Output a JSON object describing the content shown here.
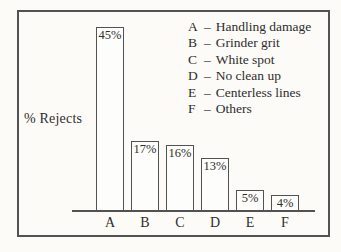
{
  "chart_data": {
    "type": "bar",
    "title": "",
    "ylabel": "% Rejects",
    "xlabel": "",
    "categories": [
      "A",
      "B",
      "C",
      "D",
      "E",
      "F"
    ],
    "values": [
      45,
      17,
      16,
      13,
      5,
      4
    ],
    "bar_labels": [
      "45%",
      "17%",
      "16%",
      "13%",
      "5%",
      "4%"
    ],
    "ylim": [
      0,
      50
    ],
    "grid": false,
    "axis_lines": "x-only",
    "legend_position": "top-right",
    "legend_separator": "–",
    "legend": [
      {
        "key": "A",
        "label": "Handling damage"
      },
      {
        "key": "B",
        "label": "Grinder grit"
      },
      {
        "key": "C",
        "label": "White spot"
      },
      {
        "key": "D",
        "label": "No clean up"
      },
      {
        "key": "E",
        "label": "Centerless lines"
      },
      {
        "key": "F",
        "label": "Others"
      }
    ]
  },
  "colors": {
    "background": "#fcfbf8",
    "frame_border": "#525252",
    "axis_line": "#525252",
    "bar_border": "#525252",
    "bar_fill": "#fdfdfb",
    "text": "#2e2e2e"
  }
}
